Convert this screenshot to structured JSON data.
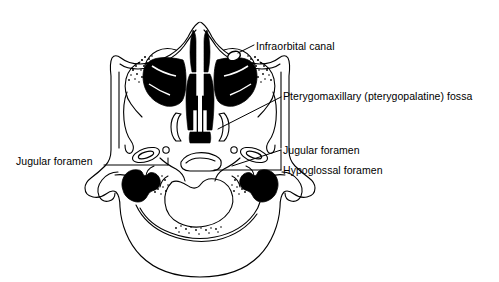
{
  "figure": {
    "background_color": "#ffffff",
    "stroke_color": "#000000",
    "fill_color": "#000000",
    "width": 499,
    "height": 282
  },
  "labels": {
    "infraorbital_canal": "Infraorbital canal",
    "pterygomaxillary_fossa": "Pterygomaxillary (pterygopalatine) fossa",
    "jugular_foramen_right": "Jugular foramen",
    "hypoglossal_foramen": "Hypoglossal foramen",
    "jugular_foramen_left": "Jugular foramen"
  },
  "structures": [
    {
      "name": "nasal-cavity",
      "fill": "#000000"
    },
    {
      "name": "maxillary-sinus-left",
      "fill": "#000000"
    },
    {
      "name": "maxillary-sinus-right",
      "fill": "#000000"
    },
    {
      "name": "mastoid-air-cells-left",
      "fill": "#000000"
    },
    {
      "name": "mastoid-air-cells-right",
      "fill": "#000000"
    },
    {
      "name": "zygomatic-arch-left",
      "fill": "none"
    },
    {
      "name": "zygomatic-arch-right",
      "fill": "none"
    },
    {
      "name": "occipital-bone",
      "fill": "none"
    },
    {
      "name": "foramen-magnum",
      "fill": "none"
    },
    {
      "name": "infraorbital-canal-marker",
      "fill": "none"
    }
  ]
}
